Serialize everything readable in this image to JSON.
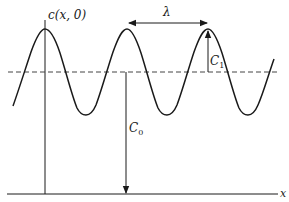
{
  "diagram": {
    "labels": {
      "curve": "c(x, 0)",
      "wavelength": "λ",
      "amplitude_main": "C",
      "amplitude_sub": "1",
      "mean_main": "C",
      "mean_sub": "0",
      "x_axis": "x"
    },
    "elements": {
      "vertical_axis": "c(x,0) axis",
      "horizontal_axis": "x axis",
      "mean_line": "dashed line at mean level C0",
      "wave": "sinusoid with three visible peaks",
      "wavelength_arrow": "double-headed arrow between adjacent peaks",
      "amplitude_arrow": "arrow from mean line up to peak",
      "mean_arrow": "arrow from mean line down to x axis"
    },
    "colors": {
      "line": "#1a1a1a",
      "dashed": "#444444",
      "background": "#ffffff"
    }
  }
}
